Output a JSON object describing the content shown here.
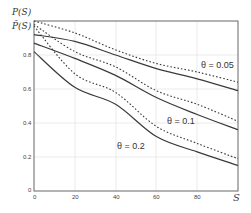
{
  "chart_data": {
    "type": "line",
    "title": "",
    "xlabel": "S",
    "ylabel": [
      "P(S)",
      "P̃(S)"
    ],
    "xlim": [
      0,
      100
    ],
    "ylim": [
      0,
      1
    ],
    "grid": true,
    "x_ticks": [
      "0",
      "20",
      "40",
      "60",
      "80"
    ],
    "x_end_label": "S",
    "y_ticks": [
      "0",
      "0.2",
      "0.4",
      "0.6",
      "0.8"
    ],
    "x": [
      0,
      20,
      40,
      60,
      80,
      100
    ],
    "series": [
      {
        "name": "θ = 0.05 P(S)",
        "style": "dotted",
        "values": [
          1.0,
          0.93,
          0.83,
          0.75,
          0.7,
          0.64
        ]
      },
      {
        "name": "θ = 0.05 P̃(S)",
        "style": "solid",
        "values": [
          0.92,
          0.88,
          0.8,
          0.72,
          0.66,
          0.59
        ]
      },
      {
        "name": "θ = 0.1 P(S)",
        "style": "dotted",
        "values": [
          0.98,
          0.82,
          0.73,
          0.59,
          0.51,
          0.41
        ]
      },
      {
        "name": "θ = 0.1 P̃(S)",
        "style": "solid",
        "values": [
          0.87,
          0.78,
          0.68,
          0.55,
          0.45,
          0.36
        ]
      },
      {
        "name": "θ = 0.2 P(S)",
        "style": "dotted",
        "values": [
          0.97,
          0.69,
          0.58,
          0.38,
          0.28,
          0.19
        ]
      },
      {
        "name": "θ = 0.2 P̃(S)",
        "style": "solid",
        "values": [
          0.82,
          0.61,
          0.51,
          0.32,
          0.23,
          0.15
        ]
      }
    ],
    "annotations": [
      {
        "text": "θ = 0.05",
        "x": 84,
        "y": 0.73
      },
      {
        "text": "θ = 0.1",
        "x": 65,
        "y": 0.41
      },
      {
        "text": "θ = 0.2",
        "x": 43,
        "y": 0.26
      }
    ],
    "legend": "none"
  },
  "labels": {
    "ylabel_top": "P(S)",
    "ylabel_bottom": "P̃(S)",
    "x_end": "S",
    "theta_005": "θ = 0.05",
    "theta_01": "θ = 0.1",
    "theta_02": "θ = 0.2",
    "xt0": "0",
    "xt20": "20",
    "xt40": "40",
    "xt60": "60",
    "xt80": "80",
    "yt0": "0",
    "yt02": "0.2",
    "yt04": "0.4",
    "yt06": "0.6",
    "yt08": "0.8"
  },
  "colors": {
    "axis": "#555555",
    "grid": "#e2e2e2",
    "curve": "#3a3a3a"
  }
}
